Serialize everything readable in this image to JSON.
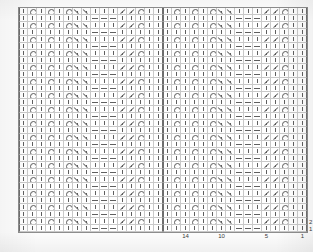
{
  "document": {
    "title": "Lace Knitting Chart",
    "kind": "knitting-stitch-chart",
    "reading_direction": "right-to-left",
    "ink_color": "#5f5f5f",
    "grid_line_color": "#c9c9c9",
    "repeat_line_color": "#6e6e6e",
    "frame_color": "#8d8d8d",
    "paper_color": "#ffffff"
  },
  "chart": {
    "columns": 32,
    "rows": 32,
    "cell_width_px": 9,
    "cell_height_px": 7,
    "repeat_width_stitches": 16,
    "repeat_height_rows": 8,
    "repeat_boundary_columns": [
      0,
      16,
      32
    ],
    "symbol_legend": [
      {
        "key": "knit",
        "name": "knit-symbol",
        "glyph": "|",
        "description": "knit stitch"
      },
      {
        "key": "purl",
        "name": "purl-symbol",
        "glyph": "—",
        "description": "purl stitch"
      },
      {
        "key": "yo",
        "name": "yarn-over-symbol",
        "glyph": "O",
        "description": "yarn over"
      },
      {
        "key": "k2tog",
        "name": "k2tog-symbol",
        "glyph": "/",
        "description": "knit two together, right-leaning decrease"
      },
      {
        "key": "ssk",
        "name": "ssk-symbol",
        "glyph": "\\",
        "description": "slip slip knit, left-leaning decrease"
      }
    ],
    "column_labels": [
      {
        "text": "14",
        "column_index_from_right": 14
      },
      {
        "text": "10",
        "column_index_from_right": 10
      },
      {
        "text": "5",
        "column_index_from_right": 5
      },
      {
        "text": "1",
        "column_index_from_right": 1
      }
    ],
    "row_labels": [
      {
        "text": "2",
        "row_from_bottom": 2
      },
      {
        "text": "1",
        "row_from_bottom": 1
      }
    ],
    "repeat_pattern_16": {
      "row_types_top_to_bottom": [
        "A",
        "B",
        "A",
        "B",
        "A",
        "B",
        "A",
        "B"
      ],
      "rowA": [
        "knit",
        "yo",
        "knit",
        "yo",
        "knit",
        "yo",
        "k2tog",
        "k2tog",
        "knit",
        "knit",
        "knit",
        "ssk",
        "ssk",
        "yo",
        "knit",
        "knit"
      ],
      "rowB": [
        "knit",
        "knit",
        "knit",
        "knit",
        "knit",
        "knit",
        "knit",
        "knit",
        "purl",
        "purl",
        "purl",
        "knit",
        "knit",
        "knit",
        "knit",
        "knit"
      ]
    },
    "grid_rows": [
      [
        "knit",
        "yo",
        "knit",
        "yo",
        "knit",
        "yo",
        "k2tog",
        "k2tog",
        "knit",
        "knit",
        "knit",
        "ssk",
        "ssk",
        "yo",
        "knit",
        "knit",
        "knit",
        "yo",
        "knit",
        "yo",
        "knit",
        "yo",
        "k2tog",
        "k2tog",
        "knit",
        "knit",
        "knit",
        "ssk",
        "ssk",
        "yo",
        "knit",
        "knit"
      ],
      [
        "knit",
        "knit",
        "knit",
        "knit",
        "knit",
        "knit",
        "knit",
        "knit",
        "purl",
        "purl",
        "purl",
        "knit",
        "knit",
        "knit",
        "knit",
        "knit",
        "knit",
        "knit",
        "knit",
        "knit",
        "knit",
        "knit",
        "knit",
        "knit",
        "purl",
        "purl",
        "purl",
        "knit",
        "knit",
        "knit",
        "knit",
        "knit"
      ],
      [
        "knit",
        "yo",
        "knit",
        "yo",
        "knit",
        "yo",
        "k2tog",
        "k2tog",
        "knit",
        "knit",
        "knit",
        "ssk",
        "ssk",
        "yo",
        "knit",
        "knit",
        "knit",
        "yo",
        "knit",
        "yo",
        "knit",
        "yo",
        "k2tog",
        "k2tog",
        "knit",
        "knit",
        "knit",
        "ssk",
        "ssk",
        "yo",
        "knit",
        "knit"
      ],
      [
        "knit",
        "knit",
        "knit",
        "knit",
        "knit",
        "knit",
        "knit",
        "knit",
        "purl",
        "purl",
        "purl",
        "knit",
        "knit",
        "knit",
        "knit",
        "knit",
        "knit",
        "knit",
        "knit",
        "knit",
        "knit",
        "knit",
        "knit",
        "knit",
        "purl",
        "purl",
        "purl",
        "knit",
        "knit",
        "knit",
        "knit",
        "knit"
      ],
      [
        "knit",
        "yo",
        "knit",
        "yo",
        "knit",
        "yo",
        "k2tog",
        "k2tog",
        "knit",
        "knit",
        "knit",
        "ssk",
        "ssk",
        "yo",
        "knit",
        "knit",
        "knit",
        "yo",
        "knit",
        "yo",
        "knit",
        "yo",
        "k2tog",
        "k2tog",
        "knit",
        "knit",
        "knit",
        "ssk",
        "ssk",
        "yo",
        "knit",
        "knit"
      ],
      [
        "knit",
        "knit",
        "knit",
        "knit",
        "knit",
        "knit",
        "knit",
        "knit",
        "purl",
        "purl",
        "purl",
        "knit",
        "knit",
        "knit",
        "knit",
        "knit",
        "knit",
        "knit",
        "knit",
        "knit",
        "knit",
        "knit",
        "knit",
        "knit",
        "purl",
        "purl",
        "purl",
        "knit",
        "knit",
        "knit",
        "knit",
        "knit"
      ],
      [
        "knit",
        "yo",
        "knit",
        "yo",
        "knit",
        "yo",
        "k2tog",
        "k2tog",
        "knit",
        "knit",
        "knit",
        "ssk",
        "ssk",
        "yo",
        "knit",
        "knit",
        "knit",
        "yo",
        "knit",
        "yo",
        "knit",
        "yo",
        "k2tog",
        "k2tog",
        "knit",
        "knit",
        "knit",
        "ssk",
        "ssk",
        "yo",
        "knit",
        "knit"
      ],
      [
        "knit",
        "knit",
        "knit",
        "knit",
        "knit",
        "knit",
        "knit",
        "knit",
        "purl",
        "purl",
        "purl",
        "knit",
        "knit",
        "knit",
        "knit",
        "knit",
        "knit",
        "knit",
        "knit",
        "knit",
        "knit",
        "knit",
        "knit",
        "knit",
        "purl",
        "purl",
        "purl",
        "knit",
        "knit",
        "knit",
        "knit",
        "knit"
      ],
      [
        "knit",
        "yo",
        "knit",
        "yo",
        "knit",
        "yo",
        "k2tog",
        "k2tog",
        "knit",
        "knit",
        "knit",
        "ssk",
        "ssk",
        "yo",
        "knit",
        "knit",
        "knit",
        "yo",
        "knit",
        "yo",
        "knit",
        "yo",
        "k2tog",
        "k2tog",
        "knit",
        "knit",
        "knit",
        "ssk",
        "ssk",
        "yo",
        "knit",
        "knit"
      ],
      [
        "knit",
        "knit",
        "knit",
        "knit",
        "knit",
        "knit",
        "knit",
        "knit",
        "purl",
        "purl",
        "purl",
        "knit",
        "knit",
        "knit",
        "knit",
        "knit",
        "knit",
        "knit",
        "knit",
        "knit",
        "knit",
        "knit",
        "knit",
        "knit",
        "purl",
        "purl",
        "purl",
        "knit",
        "knit",
        "knit",
        "knit",
        "knit"
      ],
      [
        "knit",
        "yo",
        "knit",
        "yo",
        "knit",
        "yo",
        "k2tog",
        "k2tog",
        "knit",
        "knit",
        "knit",
        "ssk",
        "ssk",
        "yo",
        "knit",
        "knit",
        "knit",
        "yo",
        "knit",
        "yo",
        "knit",
        "yo",
        "k2tog",
        "k2tog",
        "knit",
        "knit",
        "knit",
        "ssk",
        "ssk",
        "yo",
        "knit",
        "knit"
      ],
      [
        "knit",
        "knit",
        "knit",
        "knit",
        "knit",
        "knit",
        "knit",
        "knit",
        "purl",
        "purl",
        "purl",
        "knit",
        "knit",
        "knit",
        "knit",
        "knit",
        "knit",
        "knit",
        "knit",
        "knit",
        "knit",
        "knit",
        "knit",
        "knit",
        "purl",
        "purl",
        "purl",
        "knit",
        "knit",
        "knit",
        "knit",
        "knit"
      ],
      [
        "knit",
        "yo",
        "knit",
        "yo",
        "knit",
        "yo",
        "k2tog",
        "k2tog",
        "knit",
        "knit",
        "knit",
        "ssk",
        "ssk",
        "yo",
        "knit",
        "knit",
        "knit",
        "yo",
        "knit",
        "yo",
        "knit",
        "yo",
        "k2tog",
        "k2tog",
        "knit",
        "knit",
        "knit",
        "ssk",
        "ssk",
        "yo",
        "knit",
        "knit"
      ],
      [
        "knit",
        "knit",
        "knit",
        "knit",
        "knit",
        "knit",
        "knit",
        "knit",
        "purl",
        "purl",
        "purl",
        "knit",
        "knit",
        "knit",
        "knit",
        "knit",
        "knit",
        "knit",
        "knit",
        "knit",
        "knit",
        "knit",
        "knit",
        "knit",
        "purl",
        "purl",
        "purl",
        "knit",
        "knit",
        "knit",
        "knit",
        "knit"
      ],
      [
        "knit",
        "yo",
        "knit",
        "yo",
        "knit",
        "yo",
        "k2tog",
        "k2tog",
        "knit",
        "knit",
        "knit",
        "ssk",
        "ssk",
        "yo",
        "knit",
        "knit",
        "knit",
        "yo",
        "knit",
        "yo",
        "knit",
        "yo",
        "k2tog",
        "k2tog",
        "knit",
        "knit",
        "knit",
        "ssk",
        "ssk",
        "yo",
        "knit",
        "knit"
      ],
      [
        "knit",
        "knit",
        "knit",
        "knit",
        "knit",
        "knit",
        "knit",
        "knit",
        "purl",
        "purl",
        "purl",
        "knit",
        "knit",
        "knit",
        "knit",
        "knit",
        "knit",
        "knit",
        "knit",
        "knit",
        "knit",
        "knit",
        "knit",
        "knit",
        "purl",
        "purl",
        "purl",
        "knit",
        "knit",
        "knit",
        "knit",
        "knit"
      ],
      [
        "knit",
        "yo",
        "knit",
        "yo",
        "knit",
        "yo",
        "k2tog",
        "k2tog",
        "knit",
        "knit",
        "knit",
        "ssk",
        "ssk",
        "yo",
        "knit",
        "knit",
        "knit",
        "yo",
        "knit",
        "yo",
        "knit",
        "yo",
        "k2tog",
        "k2tog",
        "knit",
        "knit",
        "knit",
        "ssk",
        "ssk",
        "yo",
        "knit",
        "knit"
      ],
      [
        "knit",
        "knit",
        "knit",
        "knit",
        "knit",
        "knit",
        "knit",
        "knit",
        "purl",
        "purl",
        "purl",
        "knit",
        "knit",
        "knit",
        "knit",
        "knit",
        "knit",
        "knit",
        "knit",
        "knit",
        "knit",
        "knit",
        "knit",
        "knit",
        "purl",
        "purl",
        "purl",
        "knit",
        "knit",
        "knit",
        "knit",
        "knit"
      ],
      [
        "knit",
        "yo",
        "knit",
        "yo",
        "knit",
        "yo",
        "k2tog",
        "k2tog",
        "knit",
        "knit",
        "knit",
        "ssk",
        "ssk",
        "yo",
        "knit",
        "knit",
        "knit",
        "yo",
        "knit",
        "yo",
        "knit",
        "yo",
        "k2tog",
        "k2tog",
        "knit",
        "knit",
        "knit",
        "ssk",
        "ssk",
        "yo",
        "knit",
        "knit"
      ],
      [
        "knit",
        "knit",
        "knit",
        "knit",
        "knit",
        "knit",
        "knit",
        "knit",
        "purl",
        "purl",
        "purl",
        "knit",
        "knit",
        "knit",
        "knit",
        "knit",
        "knit",
        "knit",
        "knit",
        "knit",
        "knit",
        "knit",
        "knit",
        "knit",
        "purl",
        "purl",
        "purl",
        "knit",
        "knit",
        "knit",
        "knit",
        "knit"
      ],
      [
        "knit",
        "yo",
        "knit",
        "yo",
        "knit",
        "yo",
        "k2tog",
        "k2tog",
        "knit",
        "knit",
        "knit",
        "ssk",
        "ssk",
        "yo",
        "knit",
        "knit",
        "knit",
        "yo",
        "knit",
        "yo",
        "knit",
        "yo",
        "k2tog",
        "k2tog",
        "knit",
        "knit",
        "knit",
        "ssk",
        "ssk",
        "yo",
        "knit",
        "knit"
      ],
      [
        "knit",
        "knit",
        "knit",
        "knit",
        "knit",
        "knit",
        "knit",
        "knit",
        "purl",
        "purl",
        "purl",
        "knit",
        "knit",
        "knit",
        "knit",
        "knit",
        "knit",
        "knit",
        "knit",
        "knit",
        "knit",
        "knit",
        "knit",
        "knit",
        "purl",
        "purl",
        "purl",
        "knit",
        "knit",
        "knit",
        "knit",
        "knit"
      ],
      [
        "knit",
        "yo",
        "knit",
        "yo",
        "knit",
        "yo",
        "k2tog",
        "k2tog",
        "knit",
        "knit",
        "knit",
        "ssk",
        "ssk",
        "yo",
        "knit",
        "knit",
        "knit",
        "yo",
        "knit",
        "yo",
        "knit",
        "yo",
        "k2tog",
        "k2tog",
        "knit",
        "knit",
        "knit",
        "ssk",
        "ssk",
        "yo",
        "knit",
        "knit"
      ],
      [
        "knit",
        "knit",
        "knit",
        "knit",
        "knit",
        "knit",
        "knit",
        "knit",
        "purl",
        "purl",
        "purl",
        "knit",
        "knit",
        "knit",
        "knit",
        "knit",
        "knit",
        "knit",
        "knit",
        "knit",
        "knit",
        "knit",
        "knit",
        "knit",
        "purl",
        "purl",
        "purl",
        "knit",
        "knit",
        "knit",
        "knit",
        "knit"
      ],
      [
        "knit",
        "yo",
        "knit",
        "yo",
        "knit",
        "yo",
        "k2tog",
        "k2tog",
        "knit",
        "knit",
        "knit",
        "ssk",
        "ssk",
        "yo",
        "knit",
        "knit",
        "knit",
        "yo",
        "knit",
        "yo",
        "knit",
        "yo",
        "k2tog",
        "k2tog",
        "knit",
        "knit",
        "knit",
        "ssk",
        "ssk",
        "yo",
        "knit",
        "knit"
      ],
      [
        "knit",
        "knit",
        "knit",
        "knit",
        "knit",
        "knit",
        "knit",
        "knit",
        "purl",
        "purl",
        "purl",
        "knit",
        "knit",
        "knit",
        "knit",
        "knit",
        "knit",
        "knit",
        "knit",
        "knit",
        "knit",
        "knit",
        "knit",
        "knit",
        "purl",
        "purl",
        "purl",
        "knit",
        "knit",
        "knit",
        "knit",
        "knit"
      ],
      [
        "knit",
        "yo",
        "knit",
        "yo",
        "knit",
        "yo",
        "k2tog",
        "k2tog",
        "knit",
        "knit",
        "knit",
        "ssk",
        "ssk",
        "yo",
        "knit",
        "knit",
        "knit",
        "yo",
        "knit",
        "yo",
        "knit",
        "yo",
        "k2tog",
        "k2tog",
        "knit",
        "knit",
        "knit",
        "ssk",
        "ssk",
        "yo",
        "knit",
        "knit"
      ],
      [
        "knit",
        "knit",
        "knit",
        "knit",
        "knit",
        "knit",
        "knit",
        "knit",
        "purl",
        "purl",
        "purl",
        "knit",
        "knit",
        "knit",
        "knit",
        "knit",
        "knit",
        "knit",
        "knit",
        "knit",
        "knit",
        "knit",
        "knit",
        "knit",
        "purl",
        "purl",
        "purl",
        "knit",
        "knit",
        "knit",
        "knit",
        "knit"
      ],
      [
        "knit",
        "yo",
        "knit",
        "yo",
        "knit",
        "yo",
        "k2tog",
        "k2tog",
        "knit",
        "knit",
        "knit",
        "ssk",
        "ssk",
        "yo",
        "knit",
        "knit",
        "knit",
        "yo",
        "knit",
        "yo",
        "knit",
        "yo",
        "k2tog",
        "k2tog",
        "knit",
        "knit",
        "knit",
        "ssk",
        "ssk",
        "yo",
        "knit",
        "knit"
      ],
      [
        "knit",
        "knit",
        "knit",
        "knit",
        "knit",
        "knit",
        "knit",
        "knit",
        "purl",
        "purl",
        "purl",
        "knit",
        "knit",
        "knit",
        "knit",
        "knit",
        "knit",
        "knit",
        "knit",
        "knit",
        "knit",
        "knit",
        "knit",
        "knit",
        "purl",
        "purl",
        "purl",
        "knit",
        "knit",
        "knit",
        "knit",
        "knit"
      ],
      [
        "knit",
        "yo",
        "knit",
        "yo",
        "knit",
        "yo",
        "k2tog",
        "k2tog",
        "knit",
        "knit",
        "knit",
        "ssk",
        "ssk",
        "yo",
        "knit",
        "knit",
        "knit",
        "yo",
        "knit",
        "yo",
        "knit",
        "yo",
        "k2tog",
        "k2tog",
        "knit",
        "knit",
        "knit",
        "ssk",
        "ssk",
        "yo",
        "knit",
        "knit"
      ],
      [
        "knit",
        "knit",
        "knit",
        "knit",
        "knit",
        "knit",
        "knit",
        "knit",
        "purl",
        "purl",
        "purl",
        "knit",
        "knit",
        "knit",
        "knit",
        "knit",
        "knit",
        "knit",
        "knit",
        "knit",
        "knit",
        "knit",
        "knit",
        "knit",
        "purl",
        "purl",
        "purl",
        "knit",
        "knit",
        "knit",
        "knit",
        "knit"
      ]
    ]
  }
}
